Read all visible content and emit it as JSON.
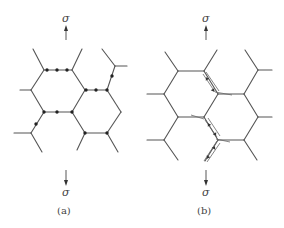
{
  "figure": {
    "panels": [
      {
        "id": "a",
        "caption": "(a)",
        "stress_label_top": "σ",
        "stress_label_bottom": "σ",
        "description": "Honeycomb cell walls with plastic hinges (dots) formed at cell-wall joints and along walls under tension"
      },
      {
        "id": "b",
        "caption": "(b)",
        "stress_label_top": "σ",
        "stress_label_bottom": "σ",
        "description": "Honeycomb with cell walls sliding/fracturing along inclined walls, indicated by shear arrows"
      }
    ],
    "colors": {
      "line": "#555555",
      "dot": "#222222",
      "text": "#444444",
      "background": "#ffffff"
    }
  }
}
